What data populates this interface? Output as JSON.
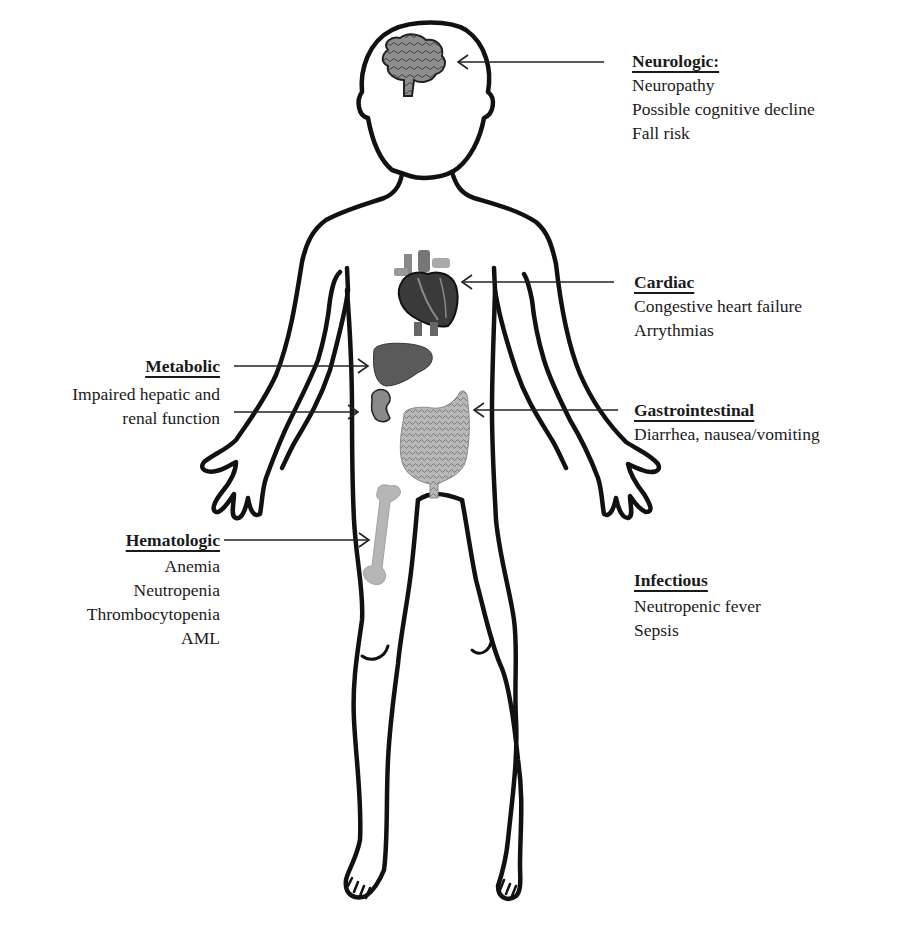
{
  "figure": {
    "type": "body-system-diagram",
    "colors": {
      "outline": "#111111",
      "arrow": "#222222",
      "text": "#1a1a1a",
      "organ_dark": "#3a3a3a",
      "organ_mid": "#7a7a7a",
      "organ_light": "#b0b0b0"
    }
  },
  "categories": {
    "neurologic": {
      "title": "Neurologic:",
      "organ": "brain",
      "items": [
        "Neuropathy",
        "Possible cognitive decline",
        "Fall risk"
      ]
    },
    "cardiac": {
      "title": "Cardiac",
      "organ": "heart",
      "items": [
        "Congestive heart failure",
        "Arrythmias"
      ]
    },
    "metabolic": {
      "title": "Metabolic",
      "organ": "liver and kidney",
      "items": [
        "Impaired hepatic and",
        "renal function"
      ]
    },
    "gastrointestinal": {
      "title": "Gastrointestinal",
      "organ": "intestines",
      "items": [
        "Diarrhea, nausea/vomiting"
      ]
    },
    "hematologic": {
      "title": "Hematologic",
      "organ": "femur bone",
      "items": [
        "Anemia",
        "Neutropenia",
        "Thrombocytopenia",
        "AML"
      ]
    },
    "infectious": {
      "title": "Infectious",
      "organ": "none",
      "items": [
        "Neutropenic fever",
        "Sepsis"
      ]
    }
  }
}
